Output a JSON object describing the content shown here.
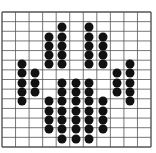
{
  "figure": {
    "type": "dot-grid-pattern",
    "grid": {
      "columns": 11,
      "rows": 14,
      "left": 2,
      "top": 12,
      "right": 151,
      "bottom": 147,
      "line_color": "#555555",
      "background": "#ffffff"
    },
    "dot_color": "#111111",
    "dot_diameter": 9,
    "dots": [
      [
        62,
        27
      ],
      [
        89,
        27
      ],
      [
        49,
        37
      ],
      [
        62,
        37
      ],
      [
        89,
        37
      ],
      [
        103,
        37
      ],
      [
        49,
        46
      ],
      [
        62,
        46
      ],
      [
        89,
        46
      ],
      [
        103,
        46
      ],
      [
        49,
        55
      ],
      [
        62,
        55
      ],
      [
        89,
        55
      ],
      [
        103,
        55
      ],
      [
        22,
        64
      ],
      [
        49,
        64
      ],
      [
        62,
        64
      ],
      [
        89,
        64
      ],
      [
        103,
        64
      ],
      [
        130,
        64
      ],
      [
        22,
        73
      ],
      [
        35,
        73
      ],
      [
        117,
        73
      ],
      [
        130,
        73
      ],
      [
        22,
        83
      ],
      [
        35,
        83
      ],
      [
        62,
        83
      ],
      [
        76,
        83
      ],
      [
        89,
        83
      ],
      [
        117,
        83
      ],
      [
        130,
        83
      ],
      [
        22,
        92
      ],
      [
        35,
        92
      ],
      [
        62,
        92
      ],
      [
        76,
        92
      ],
      [
        89,
        92
      ],
      [
        117,
        92
      ],
      [
        130,
        92
      ],
      [
        22,
        101
      ],
      [
        49,
        101
      ],
      [
        62,
        101
      ],
      [
        76,
        101
      ],
      [
        89,
        101
      ],
      [
        103,
        101
      ],
      [
        130,
        101
      ],
      [
        49,
        111
      ],
      [
        62,
        111
      ],
      [
        76,
        111
      ],
      [
        89,
        111
      ],
      [
        103,
        111
      ],
      [
        49,
        120
      ],
      [
        62,
        120
      ],
      [
        76,
        120
      ],
      [
        89,
        120
      ],
      [
        103,
        120
      ],
      [
        49,
        129
      ],
      [
        62,
        129
      ],
      [
        76,
        129
      ],
      [
        89,
        129
      ],
      [
        103,
        129
      ],
      [
        62,
        139
      ],
      [
        76,
        139
      ],
      [
        89,
        139
      ]
    ]
  }
}
